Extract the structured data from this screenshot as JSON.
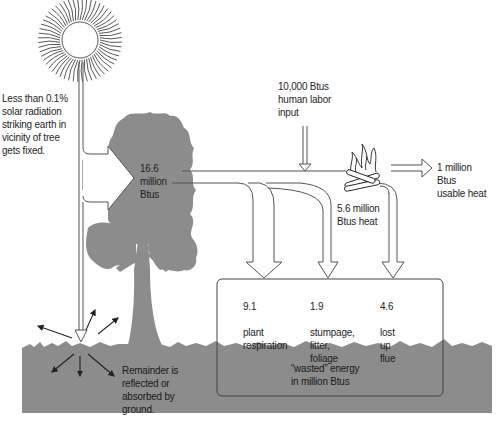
{
  "diagram": {
    "type": "energy-flow",
    "colors": {
      "ground": "#8c8c8c",
      "tree": "#8c8c8c",
      "line": "#555555",
      "text": "#1e1e1e",
      "background": "#ffffff"
    },
    "sun": {
      "icon": "sun-icon",
      "label": "Less than 0.1%\nsolar radiation\nstriking earth in\nvicinity of tree\ngets fixed."
    },
    "tree": {
      "icon": "tree-icon",
      "value_label": "16.6\nmillion\nBtus"
    },
    "labor_input": {
      "label": "10,000 Btus\nhuman labor\ninput"
    },
    "fire": {
      "icon": "fire-icon",
      "label": "5.6 million\nBtus heat"
    },
    "usable_heat": {
      "label": "1 million\nBtus\nusable heat"
    },
    "ground": {
      "label": "Remainder is\nreflected or\nabsorbed by\nground."
    },
    "wasted_box": {
      "caption": "“wasted” energy\nin million Btus",
      "items": [
        {
          "value": "9.1",
          "label": "plant\nrespiration"
        },
        {
          "value": "1.9",
          "label": "stumpage,\nlitter,\nfoliage"
        },
        {
          "value": "4.6",
          "label": "lost\nup\nflue"
        }
      ]
    }
  }
}
